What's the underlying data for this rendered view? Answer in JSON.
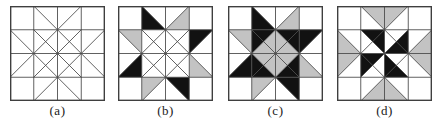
{
  "figure": {
    "background": "#ffffff",
    "grid_size": 4,
    "cell_px": 24
  },
  "palette": {
    "black": "#121212",
    "gray": "#c3c3c3",
    "white": "#ffffff",
    "line": "#4d4d4d",
    "border": "#3f3f3f",
    "label_color": "#1a1a1a"
  },
  "line_structure": {
    "v_arms": [
      [
        1,
        0,
        2,
        1
      ],
      [
        3,
        0,
        2,
        1
      ],
      [
        1,
        4,
        2,
        3
      ],
      [
        3,
        4,
        2,
        3
      ],
      [
        0,
        1,
        1,
        2
      ],
      [
        0,
        3,
        1,
        2
      ],
      [
        4,
        1,
        3,
        2
      ],
      [
        4,
        3,
        3,
        2
      ]
    ],
    "center_diagonals": [
      [
        1,
        1,
        2,
        2
      ],
      [
        2,
        1,
        1,
        2
      ],
      [
        2,
        1,
        3,
        2
      ],
      [
        3,
        1,
        2,
        2
      ],
      [
        1,
        2,
        2,
        3
      ],
      [
        2,
        2,
        1,
        3
      ],
      [
        2,
        2,
        3,
        3
      ],
      [
        3,
        2,
        2,
        3
      ]
    ]
  },
  "blocks": [
    {
      "id": "a",
      "label": "(a)",
      "fills": []
    },
    {
      "id": "b",
      "label": "(b)",
      "fills": [
        {
          "points": [
            [
              1,
              0
            ],
            [
              1,
              1
            ],
            [
              2,
              1
            ]
          ],
          "color": "black"
        },
        {
          "points": [
            [
              3,
              0
            ],
            [
              3,
              1
            ],
            [
              2,
              1
            ]
          ],
          "color": "gray"
        },
        {
          "points": [
            [
              3,
              1
            ],
            [
              4,
              1
            ],
            [
              3,
              2
            ]
          ],
          "color": "black"
        },
        {
          "points": [
            [
              3,
              2
            ],
            [
              3,
              3
            ],
            [
              4,
              3
            ]
          ],
          "color": "gray"
        },
        {
          "points": [
            [
              3,
              4
            ],
            [
              3,
              3
            ],
            [
              2,
              3
            ]
          ],
          "color": "black"
        },
        {
          "points": [
            [
              1,
              4
            ],
            [
              1,
              3
            ],
            [
              2,
              3
            ]
          ],
          "color": "gray"
        },
        {
          "points": [
            [
              0,
              1
            ],
            [
              1,
              1
            ],
            [
              1,
              2
            ]
          ],
          "color": "gray"
        },
        {
          "points": [
            [
              0,
              3
            ],
            [
              1,
              3
            ],
            [
              1,
              2
            ]
          ],
          "color": "black"
        }
      ]
    },
    {
      "id": "c",
      "label": "(c)",
      "fills": [
        {
          "points": [
            [
              1,
              0
            ],
            [
              1,
              1
            ],
            [
              2,
              1
            ]
          ],
          "color": "black"
        },
        {
          "points": [
            [
              3,
              0
            ],
            [
              3,
              1
            ],
            [
              2,
              1
            ]
          ],
          "color": "gray"
        },
        {
          "points": [
            [
              3,
              1
            ],
            [
              4,
              1
            ],
            [
              3,
              2
            ]
          ],
          "color": "black"
        },
        {
          "points": [
            [
              3,
              2
            ],
            [
              3,
              3
            ],
            [
              4,
              3
            ]
          ],
          "color": "gray"
        },
        {
          "points": [
            [
              3,
              4
            ],
            [
              3,
              3
            ],
            [
              2,
              3
            ]
          ],
          "color": "black"
        },
        {
          "points": [
            [
              1,
              4
            ],
            [
              1,
              3
            ],
            [
              2,
              3
            ]
          ],
          "color": "gray"
        },
        {
          "points": [
            [
              0,
              1
            ],
            [
              1,
              1
            ],
            [
              1,
              2
            ]
          ],
          "color": "gray"
        },
        {
          "points": [
            [
              0,
              3
            ],
            [
              1,
              3
            ],
            [
              1,
              2
            ]
          ],
          "color": "black"
        },
        {
          "points": [
            [
              1,
              1
            ],
            [
              2,
              1
            ],
            [
              1,
              2
            ]
          ],
          "color": "black"
        },
        {
          "points": [
            [
              2,
              1
            ],
            [
              3,
              1
            ],
            [
              3,
              2
            ]
          ],
          "color": "black"
        },
        {
          "points": [
            [
              1,
              2
            ],
            [
              1,
              3
            ],
            [
              2,
              3
            ]
          ],
          "color": "black"
        },
        {
          "points": [
            [
              3,
              2
            ],
            [
              3,
              3
            ],
            [
              2,
              3
            ]
          ],
          "color": "black"
        },
        {
          "points": [
            [
              2,
              1
            ],
            [
              2,
              2
            ],
            [
              1,
              2
            ]
          ],
          "color": "gray"
        },
        {
          "points": [
            [
              2,
              1
            ],
            [
              2,
              2
            ],
            [
              3,
              2
            ]
          ],
          "color": "gray"
        },
        {
          "points": [
            [
              1,
              2
            ],
            [
              2,
              2
            ],
            [
              2,
              3
            ]
          ],
          "color": "gray"
        },
        {
          "points": [
            [
              2,
              2
            ],
            [
              3,
              2
            ],
            [
              2,
              3
            ]
          ],
          "color": "gray"
        }
      ]
    },
    {
      "id": "d",
      "label": "(d)",
      "fills": [
        {
          "points": [
            [
              1,
              0
            ],
            [
              3,
              0
            ],
            [
              2,
              1
            ]
          ],
          "color": "gray"
        },
        {
          "points": [
            [
              4,
              1
            ],
            [
              4,
              3
            ],
            [
              3,
              2
            ]
          ],
          "color": "gray"
        },
        {
          "points": [
            [
              1,
              4
            ],
            [
              3,
              4
            ],
            [
              2,
              3
            ]
          ],
          "color": "gray"
        },
        {
          "points": [
            [
              0,
              1
            ],
            [
              0,
              3
            ],
            [
              1,
              2
            ]
          ],
          "color": "gray"
        },
        {
          "points": [
            [
              1,
              1
            ],
            [
              2,
              1
            ],
            [
              2,
              2
            ]
          ],
          "color": "black"
        },
        {
          "points": [
            [
              3,
              1
            ],
            [
              3,
              2
            ],
            [
              2,
              2
            ]
          ],
          "color": "black"
        },
        {
          "points": [
            [
              3,
              3
            ],
            [
              2,
              3
            ],
            [
              2,
              2
            ]
          ],
          "color": "black"
        },
        {
          "points": [
            [
              1,
              3
            ],
            [
              1,
              2
            ],
            [
              2,
              2
            ]
          ],
          "color": "black"
        }
      ]
    }
  ]
}
